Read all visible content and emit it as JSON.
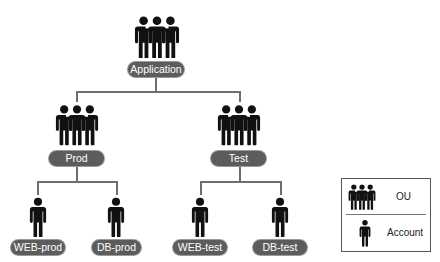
{
  "diagram": {
    "root": {
      "label": "Application",
      "type": "OU"
    },
    "ous": [
      {
        "label": "Prod",
        "type": "OU",
        "accounts": [
          {
            "label": "WEB-prod",
            "type": "Account"
          },
          {
            "label": "DB-prod",
            "type": "Account"
          }
        ]
      },
      {
        "label": "Test",
        "type": "OU",
        "accounts": [
          {
            "label": "WEB-test",
            "type": "Account"
          },
          {
            "label": "DB-test",
            "type": "Account"
          }
        ]
      }
    ]
  },
  "legend": {
    "items": [
      {
        "icon": "group-people-icon",
        "label": "OU"
      },
      {
        "icon": "person-icon",
        "label": "Account"
      }
    ]
  },
  "colors": {
    "pill": "#5c5c5c",
    "pill_text": "#ffffff",
    "connector": "#6e6e6e",
    "icon": "#111111"
  }
}
